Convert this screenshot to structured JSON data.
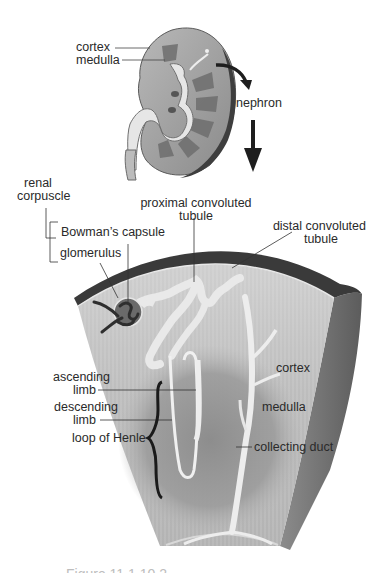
{
  "diagram": {
    "colors": {
      "background": "#ffffff",
      "text": "#2a2a2a",
      "tissue_light": "#c9c9c9",
      "tissue_mid": "#a9a9a9",
      "tissue_dark": "#4a4a4a",
      "capsule_dark": "#3a3a3a",
      "tubule": "#ededed",
      "arrow": "#1e1e1e"
    },
    "kidney_labels": {
      "cortex": "cortex",
      "medulla": "medulla",
      "nephron": "nephron"
    },
    "renal_corpuscle": {
      "group_label_line1": "renal",
      "group_label_line2": "corpuscle",
      "bowmans_capsule": "Bowman’s capsule",
      "glomerulus": "glomerulus"
    },
    "tubules": {
      "proximal_line1": "proximal convoluted",
      "proximal_line2": "tubule",
      "distal_line1": "distal convoluted",
      "distal_line2": "tubule"
    },
    "section_labels": {
      "cortex": "cortex",
      "medulla": "medulla",
      "collecting_duct": "collecting duct"
    },
    "loop_of_henle": {
      "ascending_line1": "ascending",
      "ascending_line2": "limb",
      "descending_line1": "descending",
      "descending_line2": "limb",
      "group_label": "loop of Henle"
    },
    "caption": "Figure 11.1.10.2"
  }
}
